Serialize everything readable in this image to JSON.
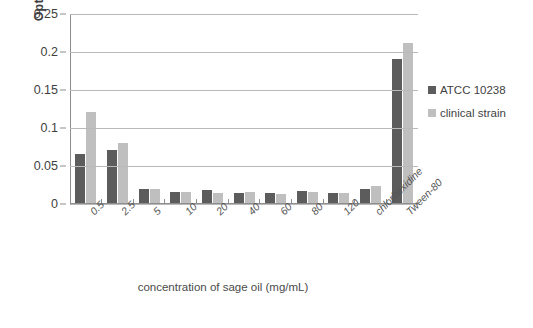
{
  "chart_data": {
    "type": "bar",
    "title": "",
    "xlabel": "concentration of sage oil (mg/mL)",
    "ylabel": "Optical density",
    "ylim": [
      0,
      0.25
    ],
    "yticks": [
      "0",
      "0.05",
      "0.1",
      "0.15",
      "0.2",
      "0.25"
    ],
    "ytick_values": [
      0,
      0.05,
      0.1,
      0.15,
      0.2,
      0.25
    ],
    "grid": true,
    "legend_position": "right",
    "categories": [
      "0.5",
      "2.5",
      "5",
      "10",
      "20",
      "40",
      "60",
      "80",
      "120",
      "chlorhexidine",
      "Tween-80"
    ],
    "series": [
      {
        "name": "ATCC 10238",
        "color": "#5c5c5c",
        "values": [
          0.065,
          0.07,
          0.019,
          0.014,
          0.017,
          0.013,
          0.013,
          0.016,
          0.013,
          0.019,
          0.19
        ]
      },
      {
        "name": "clinical strain",
        "color": "#bfbfbf",
        "values": [
          0.12,
          0.079,
          0.019,
          0.015,
          0.013,
          0.014,
          0.012,
          0.014,
          0.013,
          0.023,
          0.21
        ]
      }
    ]
  }
}
